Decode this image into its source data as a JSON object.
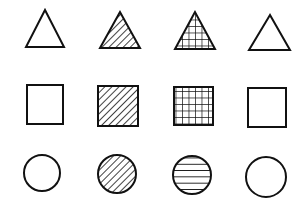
{
  "diagram": {
    "background": "#ffffff",
    "stroke": "#111111",
    "rows": [
      {
        "name": "triangles",
        "cells": [
          {
            "shape": "triangle",
            "fill": "none",
            "points": "45,10 26,47 64,47"
          },
          {
            "shape": "triangle",
            "fill": "diagonal-hatch",
            "points": "120,12 100,48 140,48"
          },
          {
            "shape": "triangle",
            "fill": "grid",
            "points": "195,12 175,49 215,49"
          },
          {
            "shape": "triangle",
            "fill": "none",
            "points": "270,15 249,50 290,50"
          }
        ]
      },
      {
        "name": "squares",
        "cells": [
          {
            "shape": "square",
            "fill": "none",
            "x": 27,
            "y": 85,
            "w": 36,
            "h": 39
          },
          {
            "shape": "square",
            "fill": "diagonal-hatch",
            "x": 98,
            "y": 86,
            "w": 40,
            "h": 40
          },
          {
            "shape": "square",
            "fill": "grid",
            "x": 174,
            "y": 87,
            "w": 39,
            "h": 38
          },
          {
            "shape": "square",
            "fill": "none",
            "x": 248,
            "y": 88,
            "w": 38,
            "h": 39
          }
        ]
      },
      {
        "name": "circles",
        "cells": [
          {
            "shape": "circle",
            "fill": "none",
            "cx": 42,
            "cy": 173,
            "r": 18
          },
          {
            "shape": "circle",
            "fill": "diagonal-hatch",
            "cx": 117,
            "cy": 174,
            "r": 19
          },
          {
            "shape": "circle",
            "fill": "horizontal-lines",
            "cx": 192,
            "cy": 175,
            "r": 19
          },
          {
            "shape": "circle",
            "fill": "none",
            "cx": 266,
            "cy": 177,
            "r": 20
          }
        ]
      }
    ]
  }
}
